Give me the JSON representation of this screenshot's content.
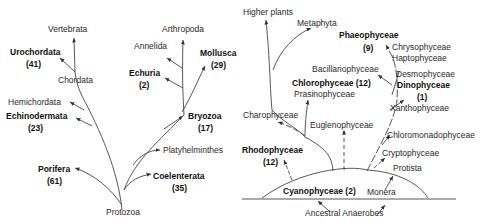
{
  "animal_tree": {
    "root": "Protozoa",
    "taxa": {
      "vertebrata": "Vertebrata",
      "urochordata": "Urochordata",
      "urochordata_count": "(41)",
      "chordata": "Chordata",
      "hemichordata": "Hemichordata",
      "echinodermata": "Echinodermata",
      "echinodermata_count": "(23)",
      "porifera": "Porifera",
      "porifera_count": "(61)",
      "arthropoda": "Arthropoda",
      "annelida": "Annelida",
      "mollusca": "Mollusca",
      "mollusca_count": "(29)",
      "echuria": "Echuria",
      "echuria_count": "(2)",
      "bryozoa": "Bryozoa",
      "bryozoa_count": "(17)",
      "platyhelminthes": "Platyhelminthes",
      "coelenterata": "Coelenterata",
      "coelenterata_count": "(35)"
    }
  },
  "plant_tree": {
    "root": "Ancestral Anaerobes",
    "taxa": {
      "higher_plants": "Higher plants",
      "metaphyta": "Metaphyta",
      "phaeophyceae": "Phaeophyceae",
      "phaeophyceae_count": "(9)",
      "chrysophyceae": "Chrysophyceae",
      "haptophyceae": "Haptophyceae",
      "bacillariophyceae": "Bacillariophyceae",
      "desmophyceae": "Desmophyceae",
      "dinophyceae": "Dinophyceae",
      "dinophyceae_count": "(1)",
      "chlorophyceae": "Chlorophyceae (12)",
      "prasinophyceae": "Prasinophyceae",
      "xanthophyceae": "Xanthophyceae",
      "charophyceae": "Charophyceae",
      "euglenophyceae": "Euglenophyceae",
      "chloromonadophyceae": "Chloromonadophyceae",
      "rhodophyceae": "Rhodophyceae",
      "rhodophyceae_count": "(12)",
      "cryptophyceae": "Cryptophyceae",
      "protista": "Protista",
      "cyanophyceae": "Cyanophyceae (2)",
      "monera": "Monera"
    }
  }
}
